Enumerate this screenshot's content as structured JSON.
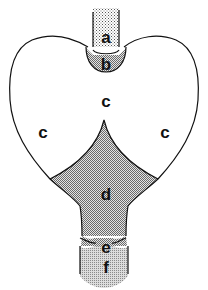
{
  "diagram": {
    "labels": {
      "a": "a",
      "b": "b",
      "c_top": "c",
      "c_left": "c",
      "c_right": "c",
      "d": "d",
      "e": "e",
      "f": "f"
    },
    "colors": {
      "outline": "#111111",
      "stipple_light": "#c8c8c8",
      "stipple_medium": "#a8a8a8",
      "background": "#ffffff"
    }
  }
}
